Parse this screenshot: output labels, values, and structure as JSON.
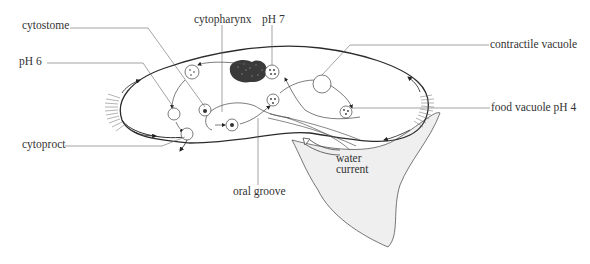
{
  "diagram": {
    "colors": {
      "line": "#4a4a4a",
      "body_outline": "#2b2b2b",
      "water_fill": "#efefef",
      "macronucleus": "#3a3a3a",
      "text": "#333333"
    },
    "labels": {
      "cytostome": "cytostome",
      "ph6": "pH 6",
      "cytoproct": "cytoproct",
      "cytopharynx": "cytopharynx",
      "ph7": "pH 7",
      "contractile_vacuole": "contractile vacuole",
      "food_vacuole_ph4": "food vacuole pH 4",
      "oral_groove": "oral groove",
      "water_current_line1": "water",
      "water_current_line2": "current"
    }
  }
}
